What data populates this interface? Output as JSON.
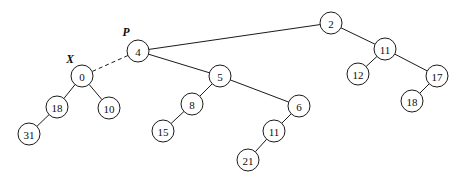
{
  "figure": {
    "type": "binary-tree-diagram",
    "width": 467,
    "height": 186,
    "background_color": "#ffffff",
    "stroke_color": "#1a1a1a",
    "node_fill_color": "#ffffff",
    "text_color": "#0d0d0d"
  },
  "nodes": [
    {
      "id": "n2",
      "label": "2",
      "cx": 331,
      "cy": 23,
      "r": 11
    },
    {
      "id": "n4",
      "label": "4",
      "cx": 138,
      "cy": 51,
      "r": 11
    },
    {
      "id": "n11r",
      "label": "11",
      "cx": 385,
      "cy": 49,
      "r": 11
    },
    {
      "id": "n0",
      "label": "0",
      "cx": 82,
      "cy": 76,
      "r": 11
    },
    {
      "id": "n5",
      "label": "5",
      "cx": 220,
      "cy": 76,
      "r": 11
    },
    {
      "id": "n12",
      "label": "12",
      "cx": 358,
      "cy": 74,
      "r": 11
    },
    {
      "id": "n17",
      "label": "17",
      "cx": 437,
      "cy": 76,
      "r": 11
    },
    {
      "id": "n18l",
      "label": "18",
      "cx": 57,
      "cy": 107,
      "r": 11
    },
    {
      "id": "n10",
      "label": "10",
      "cx": 109,
      "cy": 108,
      "r": 11
    },
    {
      "id": "n8",
      "label": "8",
      "cx": 192,
      "cy": 104,
      "r": 11
    },
    {
      "id": "n6",
      "label": "6",
      "cx": 299,
      "cy": 106,
      "r": 11
    },
    {
      "id": "n18r",
      "label": "18",
      "cx": 412,
      "cy": 101,
      "r": 11
    },
    {
      "id": "n31",
      "label": "31",
      "cx": 29,
      "cy": 134,
      "r": 11
    },
    {
      "id": "n15",
      "label": "15",
      "cx": 163,
      "cy": 131,
      "r": 11
    },
    {
      "id": "n11b",
      "label": "11",
      "cx": 274,
      "cy": 131,
      "r": 11
    },
    {
      "id": "n21",
      "label": "21",
      "cx": 248,
      "cy": 160,
      "r": 11
    }
  ],
  "edges": [
    {
      "id": "e-4-2",
      "from": "n4",
      "to": "n2",
      "style": "solid"
    },
    {
      "id": "e-4-5",
      "from": "n4",
      "to": "n5",
      "style": "solid"
    },
    {
      "id": "e-4-0",
      "from": "n4",
      "to": "n0",
      "style": "dashed"
    },
    {
      "id": "e-2-11r",
      "from": "n2",
      "to": "n11r",
      "style": "solid"
    },
    {
      "id": "e-11r-12",
      "from": "n11r",
      "to": "n12",
      "style": "solid"
    },
    {
      "id": "e-11r-17",
      "from": "n11r",
      "to": "n17",
      "style": "solid"
    },
    {
      "id": "e-17-18r",
      "from": "n17",
      "to": "n18r",
      "style": "solid"
    },
    {
      "id": "e-0-18l",
      "from": "n0",
      "to": "n18l",
      "style": "solid"
    },
    {
      "id": "e-0-10",
      "from": "n0",
      "to": "n10",
      "style": "solid"
    },
    {
      "id": "e-18l-31",
      "from": "n18l",
      "to": "n31",
      "style": "solid"
    },
    {
      "id": "e-5-8",
      "from": "n5",
      "to": "n8",
      "style": "solid"
    },
    {
      "id": "e-5-6",
      "from": "n5",
      "to": "n6",
      "style": "solid"
    },
    {
      "id": "e-8-15",
      "from": "n8",
      "to": "n15",
      "style": "solid"
    },
    {
      "id": "e-6-11b",
      "from": "n6",
      "to": "n11b",
      "style": "solid"
    },
    {
      "id": "e-11b-21",
      "from": "n11b",
      "to": "n21",
      "style": "solid"
    }
  ],
  "pointers": [
    {
      "id": "p-P",
      "label": "P",
      "x": 126,
      "y": 32,
      "target": "n4"
    },
    {
      "id": "p-X",
      "label": "X",
      "x": 70,
      "y": 59,
      "target": "n0"
    }
  ]
}
